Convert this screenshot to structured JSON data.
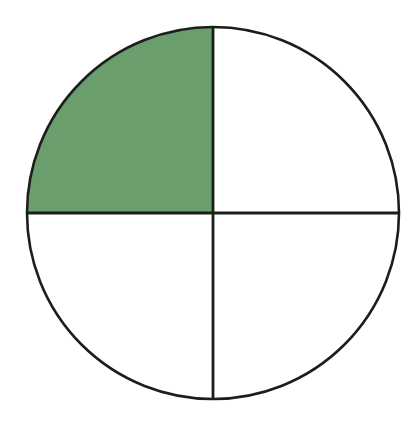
{
  "figure": {
    "kind": "fraction-circle-diagram",
    "title": "",
    "background_color": "#ffffff",
    "outline_color": "#1d1d1b",
    "shaded_color": "#6b9e6d",
    "unshaded_color": "#ffffff",
    "outline_width": 2.6,
    "divider_width": 2.8,
    "geometry": {
      "center_x": 213,
      "center_y": 213,
      "radius": 186,
      "left_edge": 27,
      "right_edge": 399,
      "top_edge": 27,
      "bottom_edge": 399
    }
  },
  "chart_data": {
    "type": "pie",
    "title": "",
    "xlabel": "",
    "ylabel": "",
    "legend": [],
    "grid": false,
    "total_parts": 4,
    "shaded_parts": 1,
    "fraction_label": "1/4",
    "fraction_value": 0.25,
    "categories": [
      "top-left quadrant",
      "top-right quadrant",
      "bottom-right quadrant",
      "bottom-left quadrant"
    ],
    "values": [
      25,
      25,
      25,
      25
    ],
    "colors": [
      "#6b9e6d",
      "#ffffff",
      "#ffffff",
      "#ffffff"
    ],
    "slices": [
      {
        "name": "top-left quadrant",
        "value": 25,
        "start_angle_deg": 180,
        "end_angle_deg": 270,
        "shaded": true,
        "color": "#6b9e6d"
      },
      {
        "name": "top-right quadrant",
        "value": 25,
        "start_angle_deg": 270,
        "end_angle_deg": 360,
        "shaded": false,
        "color": "#ffffff"
      },
      {
        "name": "bottom-right quadrant",
        "value": 25,
        "start_angle_deg": 0,
        "end_angle_deg": 90,
        "shaded": false,
        "color": "#ffffff"
      },
      {
        "name": "bottom-left quadrant",
        "value": 25,
        "start_angle_deg": 90,
        "end_angle_deg": 180,
        "shaded": false,
        "color": "#ffffff"
      }
    ],
    "annotations": []
  }
}
